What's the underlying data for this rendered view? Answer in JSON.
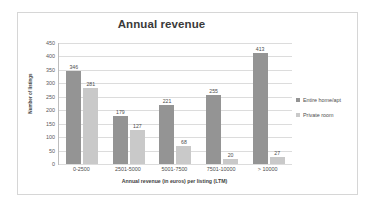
{
  "chart_data": {
    "type": "bar",
    "title": "Annual revenue",
    "xlabel": "Annual revenue (in euros) per listing (LTM)",
    "ylabel": "Number of listings",
    "categories": [
      "0-2500",
      "2501-5000",
      "5001-7500",
      "7501-10000",
      "> 10000"
    ],
    "series": [
      {
        "name": "Entire home/apt",
        "values": [
          346,
          179,
          221,
          255,
          413
        ],
        "color": "#949494"
      },
      {
        "name": "Private room",
        "values": [
          281,
          127,
          68,
          20,
          27
        ],
        "color": "#c9c9c9"
      }
    ],
    "ylim": [
      0,
      450
    ],
    "ytick_labels": [
      "450",
      "400",
      "350",
      "300",
      "250",
      "200",
      "150",
      "100",
      "50",
      "0"
    ],
    "ytick_values": [
      450,
      400,
      350,
      300,
      250,
      200,
      150,
      100,
      50,
      0
    ],
    "grid": true,
    "legend_position": "right"
  },
  "legend": {
    "items": [
      {
        "label": "Entire home/apt",
        "marker": "square-swatch-dark"
      },
      {
        "label": "Private room",
        "marker": "square-swatch-light"
      }
    ]
  }
}
